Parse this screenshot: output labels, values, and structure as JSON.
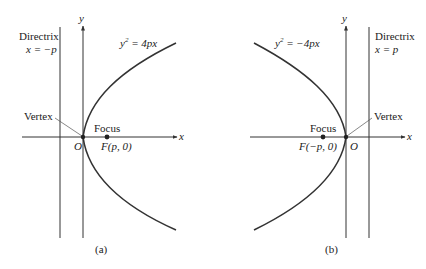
{
  "figure": {
    "panels": [
      {
        "id": "a",
        "caption": "(a)",
        "equation_prefix": "y",
        "equation_sup": "2",
        "equation_rest": " = 4px",
        "directrix_label": "Directrix",
        "directrix_eq": "x = −p",
        "vertex_label": "Vertex",
        "focus_label": "Focus",
        "focus_coord": "F(p, 0)",
        "origin_label": "O",
        "x_axis_label": "x",
        "y_axis_label": "y",
        "opens": "right"
      },
      {
        "id": "b",
        "caption": "(b)",
        "equation_prefix": "y",
        "equation_sup": "2",
        "equation_rest": " = −4px",
        "directrix_label": "Directrix",
        "directrix_eq": "x =  p",
        "vertex_label": "Vertex",
        "focus_label": "Focus",
        "focus_coord": "F(−p, 0)",
        "origin_label": "O",
        "x_axis_label": "x",
        "y_axis_label": "y",
        "opens": "left"
      }
    ],
    "colors": {
      "line": "#333333",
      "text": "#222222",
      "background": "#ffffff"
    }
  }
}
